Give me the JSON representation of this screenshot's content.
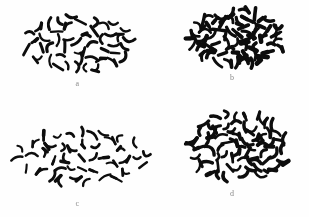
{
  "figure": {
    "type": "micrograph-plate",
    "background_color": "#fefefe",
    "ink_color": "#0d0d0d",
    "label_color": "#8a8a8a",
    "layout": "2x2",
    "width": 309,
    "height": 217
  },
  "panels": [
    {
      "id": "a",
      "label": "a",
      "position": "top-left",
      "cluster_shape": "broad-oval",
      "count": 46,
      "center": [
        78,
        40
      ],
      "radius_x": 54,
      "radius_y": 27,
      "rod_length": [
        7,
        13
      ],
      "rod_width": 2.6,
      "density": "moderate",
      "seed": 1207
    },
    {
      "id": "b",
      "label": "b",
      "position": "top-right",
      "cluster_shape": "compact-round",
      "count": 62,
      "center": [
        82,
        38
      ],
      "radius_x": 47,
      "radius_y": 27,
      "rod_length": [
        7,
        13
      ],
      "rod_width": 3.0,
      "density": "dense",
      "seed": 4391
    },
    {
      "id": "c",
      "label": "c",
      "position": "bottom-left",
      "cluster_shape": "wide-band",
      "count": 54,
      "center": [
        80,
        45
      ],
      "radius_x": 68,
      "radius_y": 26,
      "rod_length": [
        7,
        13
      ],
      "rod_width": 2.5,
      "density": "sparse",
      "seed": 8820
    },
    {
      "id": "d",
      "label": "d",
      "position": "bottom-right",
      "cluster_shape": "compact-round",
      "count": 66,
      "center": [
        83,
        42
      ],
      "radius_x": 50,
      "radius_y": 34,
      "rod_length": [
        7,
        13
      ],
      "rod_width": 2.9,
      "density": "dense",
      "seed": 6154
    }
  ]
}
